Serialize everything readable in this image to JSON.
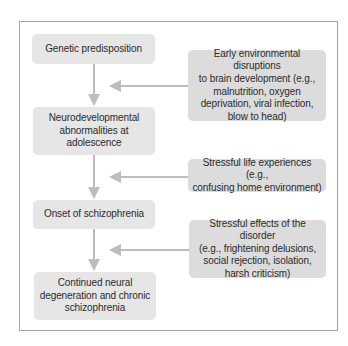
{
  "diagram": {
    "type": "flowchart",
    "colors": {
      "frame_border": "#a3a3a3",
      "main_box_fill": "#e6e6e6",
      "factor_box_fill": "#dcdcdc",
      "arrow": "#bdbdbd",
      "text": "#2b2b2b"
    },
    "main_chain": [
      {
        "id": "genetic",
        "label": "Genetic predisposition"
      },
      {
        "id": "neuro",
        "label": "Neurodevelopmental\nabnormalities at\nadolescence"
      },
      {
        "id": "onset",
        "label": "Onset of schizophrenia"
      },
      {
        "id": "continued",
        "label": "Continued neural\ndegeneration and chronic\nschizophrenia"
      }
    ],
    "factors": [
      {
        "id": "early-env",
        "label": "Early environmental disruptions\nto brain development (e.g.,\nmalnutrition, oxygen\ndeprivation, viral infection,\nblow to head)",
        "points_to": "genetic->neuro"
      },
      {
        "id": "stressful-life",
        "label": "Stressful life experiences (e.g.,\nconfusing home environment)",
        "points_to": "neuro->onset"
      },
      {
        "id": "stressful-effects",
        "label": "Stressful effects of the disorder\n(e.g., frightening delusions,\nsocial rejection, isolation,\nharsh criticism)",
        "points_to": "onset->continued"
      }
    ]
  }
}
